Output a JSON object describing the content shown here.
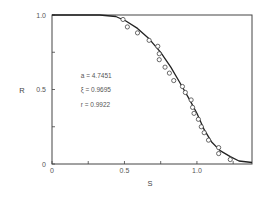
{
  "chart_data": {
    "type": "scatter",
    "title": "",
    "xlabel": "S",
    "ylabel": "R",
    "xlim": [
      0,
      1.38
    ],
    "ylim": [
      0,
      1.0
    ],
    "grid": false,
    "x_ticks": [
      {
        "value": 0,
        "label": "0"
      },
      {
        "value": 0.25,
        "label": ""
      },
      {
        "value": 0.5,
        "label": "0.5"
      },
      {
        "value": 0.75,
        "label": ""
      },
      {
        "value": 1.0,
        "label": "1.0"
      },
      {
        "value": 1.25,
        "label": ""
      }
    ],
    "y_ticks": [
      {
        "value": 0,
        "label": "0"
      },
      {
        "value": 0.25,
        "label": ""
      },
      {
        "value": 0.5,
        "label": "0.5"
      },
      {
        "value": 0.75,
        "label": ""
      },
      {
        "value": 1.0,
        "label": "1.0"
      }
    ],
    "annotations": [
      {
        "text": "a = 4.7451",
        "x": 0.35,
        "y": 0.58
      },
      {
        "text": "ξ = 0.9695",
        "x": 0.35,
        "y": 0.48
      },
      {
        "text": "r = 0.9922",
        "x": 0.35,
        "y": 0.38
      }
    ],
    "series": [
      {
        "name": "observed",
        "kind": "scatter",
        "marker": "open-circle",
        "x": [
          0.49,
          0.52,
          0.59,
          0.67,
          0.73,
          0.74,
          0.74,
          0.78,
          0.81,
          0.84,
          0.9,
          0.92,
          0.96,
          0.97,
          0.98,
          1.01,
          1.03,
          1.05,
          1.08,
          1.15,
          1.15,
          1.23
        ],
        "y": [
          0.97,
          0.92,
          0.88,
          0.83,
          0.79,
          0.74,
          0.7,
          0.65,
          0.61,
          0.56,
          0.52,
          0.48,
          0.43,
          0.38,
          0.34,
          0.3,
          0.25,
          0.21,
          0.16,
          0.11,
          0.07,
          0.03
        ]
      },
      {
        "name": "fitted",
        "kind": "line",
        "x": [
          0,
          0.33,
          0.44,
          0.51,
          0.59,
          0.67,
          0.75,
          0.82,
          0.88,
          0.95,
          1.0,
          1.05,
          1.1,
          1.16,
          1.23,
          1.29,
          1.38
        ],
        "y": [
          1.0,
          1.0,
          0.99,
          0.96,
          0.91,
          0.84,
          0.75,
          0.65,
          0.55,
          0.43,
          0.34,
          0.23,
          0.15,
          0.09,
          0.05,
          0.02,
          0.01
        ]
      }
    ]
  },
  "colors": {
    "axis": "#444444",
    "curve": "#222222",
    "marker": "#444444",
    "text": "#555555"
  }
}
